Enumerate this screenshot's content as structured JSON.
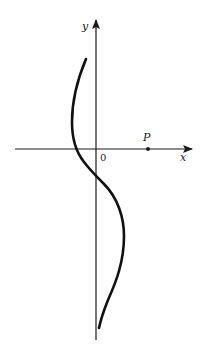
{
  "diagram": {
    "axes": {
      "x_label": "x",
      "y_label": "y",
      "origin_label": "0"
    },
    "point": {
      "label": "P",
      "on_axis": "x"
    },
    "curve": {
      "description": "S-shaped curve crossing the x-axis left of origin and the y-axis below origin",
      "color": "#111111"
    },
    "colors": {
      "stroke": "#1a1a1a",
      "background": "#ffffff"
    }
  }
}
